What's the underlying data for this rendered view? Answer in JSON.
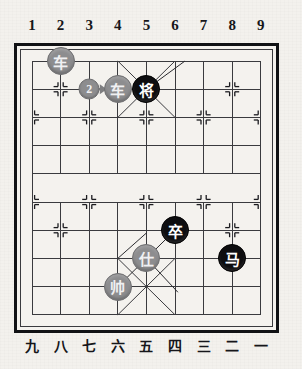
{
  "board": {
    "title": "Xiangqi Board Position",
    "columns": 9,
    "rows": 10,
    "top_labels": [
      "1",
      "2",
      "3",
      "4",
      "5",
      "6",
      "7",
      "8",
      "9"
    ],
    "bottom_labels": [
      "九",
      "八",
      "七",
      "六",
      "五",
      "四",
      "三",
      "二",
      "一"
    ],
    "colors": {
      "paper": "#f3f1ed",
      "line": "#3a3a3e",
      "frame": "#111215",
      "gray_piece": "#8d8d8f",
      "black_piece": "#0d0d0f",
      "piece_text_light": "#f0f0f2",
      "piece_text_white": "#ffffff",
      "badge": "#8d8d8f"
    },
    "pieces": [
      {
        "id": "p1",
        "glyph": "车",
        "side": "gray",
        "col": 2,
        "row": 1,
        "name": "gray-chariot-left"
      },
      {
        "id": "p2",
        "glyph": "车",
        "side": "gray",
        "col": 4,
        "row": 2,
        "name": "gray-chariot-center"
      },
      {
        "id": "p3",
        "glyph": "将",
        "side": "black",
        "col": 5,
        "row": 2,
        "name": "black-general"
      },
      {
        "id": "p4",
        "glyph": "卒",
        "side": "black",
        "col": 6,
        "row": 7,
        "name": "black-pawn"
      },
      {
        "id": "p5",
        "glyph": "马",
        "side": "black",
        "col": 8,
        "row": 8,
        "name": "black-horse"
      },
      {
        "id": "p6",
        "glyph": "仕",
        "side": "gray",
        "col": 5,
        "row": 8,
        "name": "gray-advisor"
      },
      {
        "id": "p7",
        "glyph": "帅",
        "side": "gray",
        "col": 4,
        "row": 9,
        "name": "gray-marshal"
      }
    ],
    "move_marker": {
      "label": "2",
      "from_col": 3,
      "from_row": 2,
      "to_col": 4,
      "to_row": 2,
      "name": "move-number-badge"
    },
    "cannon_points": [
      {
        "col": 2,
        "row": 2
      },
      {
        "col": 8,
        "row": 2
      },
      {
        "col": 2,
        "row": 7
      },
      {
        "col": 8,
        "row": 7
      }
    ],
    "soldier_points": [
      {
        "col": 1,
        "row": 3
      },
      {
        "col": 3,
        "row": 3
      },
      {
        "col": 5,
        "row": 3
      },
      {
        "col": 7,
        "row": 3
      },
      {
        "col": 9,
        "row": 3
      },
      {
        "col": 1,
        "row": 6
      },
      {
        "col": 3,
        "row": 6
      },
      {
        "col": 5,
        "row": 6
      },
      {
        "col": 7,
        "row": 6
      },
      {
        "col": 9,
        "row": 6
      }
    ]
  }
}
